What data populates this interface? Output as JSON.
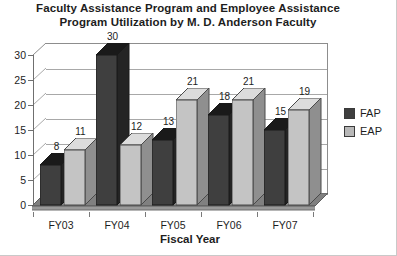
{
  "chart_data": {
    "type": "bar",
    "title": "Faculty Assistance Program and Employee Assistance Program Utilization by M. D. Anderson Faculty",
    "title_line1": "Faculty Assistance Program and Employee Assistance",
    "title_line2": "Program Utilization by M. D. Anderson Faculty",
    "xlabel": "Fiscal Year",
    "ylabel": "",
    "categories": [
      "FY03",
      "FY04",
      "FY05",
      "FY06",
      "FY07"
    ],
    "series": [
      {
        "name": "FAP",
        "values": [
          8,
          30,
          13,
          18,
          15
        ],
        "color": "#3a3a3a"
      },
      {
        "name": "EAP",
        "values": [
          11,
          12,
          21,
          21,
          19
        ],
        "color": "#b8b8b8"
      }
    ],
    "ylim": [
      0,
      30
    ],
    "yticks": [
      0,
      5,
      10,
      15,
      20,
      25,
      30
    ],
    "ytick_labels": [
      "0",
      "5",
      "10",
      "15",
      "20",
      "25",
      "30"
    ],
    "grid": true,
    "legend_position": "right",
    "three_d": true,
    "data_labels": true
  },
  "legend": {
    "entries": [
      {
        "label": "FAP",
        "color": "#3a3a3a"
      },
      {
        "label": "EAP",
        "color": "#b8b8b8"
      }
    ]
  },
  "colors": {
    "fap_front": "#3f3f3f",
    "fap_side": "#242424",
    "fap_top": "#1a1a1a",
    "eap_front": "#c4c4c4",
    "eap_side": "#8f8f8f",
    "eap_top": "#dcdcdc",
    "floor": "#808080",
    "gridline": "#a8a8a8",
    "axis": "#6f6f6f",
    "text": "#1d1d1d"
  }
}
